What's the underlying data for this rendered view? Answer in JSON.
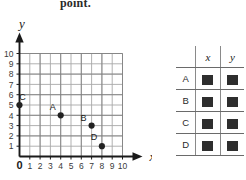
{
  "prompt": {
    "text": "point."
  },
  "graph": {
    "x_axis_label": "x",
    "y_axis_label": "y",
    "x_ticks": [
      "0",
      "1",
      "2",
      "3",
      "4",
      "5",
      "6",
      "7",
      "8",
      "9",
      "10"
    ],
    "y_ticks": [
      "1",
      "2",
      "3",
      "4",
      "5",
      "6",
      "7",
      "8",
      "9",
      "10"
    ],
    "grid_color": "#a8a8a8",
    "axis_color": "#1a1a1a",
    "point_color": "#222222",
    "points": [
      {
        "label": "A",
        "x": 4,
        "y": 4
      },
      {
        "label": "B",
        "x": 7,
        "y": 3
      },
      {
        "label": "C",
        "x": 0,
        "y": 5
      },
      {
        "label": "D",
        "x": 8,
        "y": 1
      }
    ]
  },
  "table": {
    "corner_label": "",
    "headers": [
      "x",
      "y"
    ],
    "rows": [
      {
        "label": "A",
        "x_value": "",
        "y_value": ""
      },
      {
        "label": "B",
        "x_value": "",
        "y_value": ""
      },
      {
        "label": "C",
        "x_value": "",
        "y_value": ""
      },
      {
        "label": "D",
        "x_value": "",
        "y_value": ""
      }
    ]
  }
}
